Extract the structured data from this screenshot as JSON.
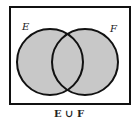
{
  "diagram": {
    "type": "venn",
    "sets": [
      {
        "label": "E",
        "cx": 50,
        "cy": 62,
        "r": 33
      },
      {
        "label": "F",
        "cx": 85,
        "cy": 62,
        "r": 33
      }
    ],
    "caption": "E ∪ F",
    "shaded_region": "union",
    "colors": {
      "fill": "#c8c8c8",
      "stroke": "#111111",
      "background": "#ffffff"
    }
  }
}
